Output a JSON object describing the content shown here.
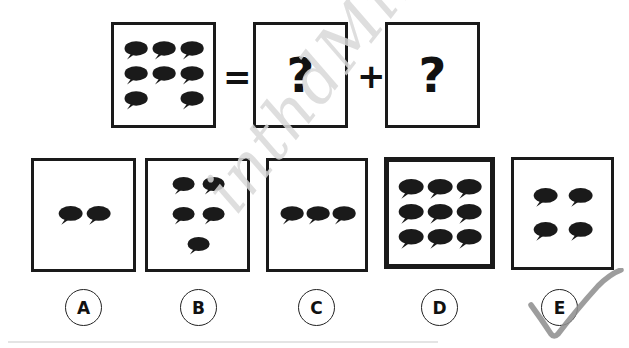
{
  "page": {
    "background_color": "#ffffff",
    "ink_color": "#1a1a1a",
    "watermark_text": "inthdMindMine",
    "watermark_color": "#d9d9d9"
  },
  "equation": {
    "operator_equals": "=",
    "operator_plus": "+",
    "question_mark": "?",
    "panels": [
      {
        "id": "given-panel",
        "kind": "bubbles",
        "bubble_count": 8,
        "rows": [
          3,
          3,
          2
        ],
        "row_layout": [
          "full",
          "full",
          "gap-center"
        ]
      },
      {
        "id": "unknown-panel-1",
        "kind": "question",
        "label": "?"
      },
      {
        "id": "unknown-panel-2",
        "kind": "question",
        "label": "?"
      }
    ]
  },
  "options": [
    {
      "letter": "A",
      "bubble_count": 2,
      "rows": [
        2
      ],
      "emphasis": "normal",
      "selected": false
    },
    {
      "letter": "B",
      "bubble_count": 5,
      "rows": [
        2,
        2,
        1
      ],
      "emphasis": "normal",
      "selected": false
    },
    {
      "letter": "C",
      "bubble_count": 3,
      "rows": [
        3
      ],
      "emphasis": "normal",
      "selected": false
    },
    {
      "letter": "D",
      "bubble_count": 9,
      "rows": [
        3,
        3,
        3
      ],
      "emphasis": "bold",
      "selected": false
    },
    {
      "letter": "E",
      "bubble_count": 4,
      "rows": [
        2,
        2
      ],
      "emphasis": "normal",
      "selected": true
    }
  ],
  "annotation": {
    "type": "check-mark",
    "over_option": "E",
    "color": "#8a8a8a"
  }
}
